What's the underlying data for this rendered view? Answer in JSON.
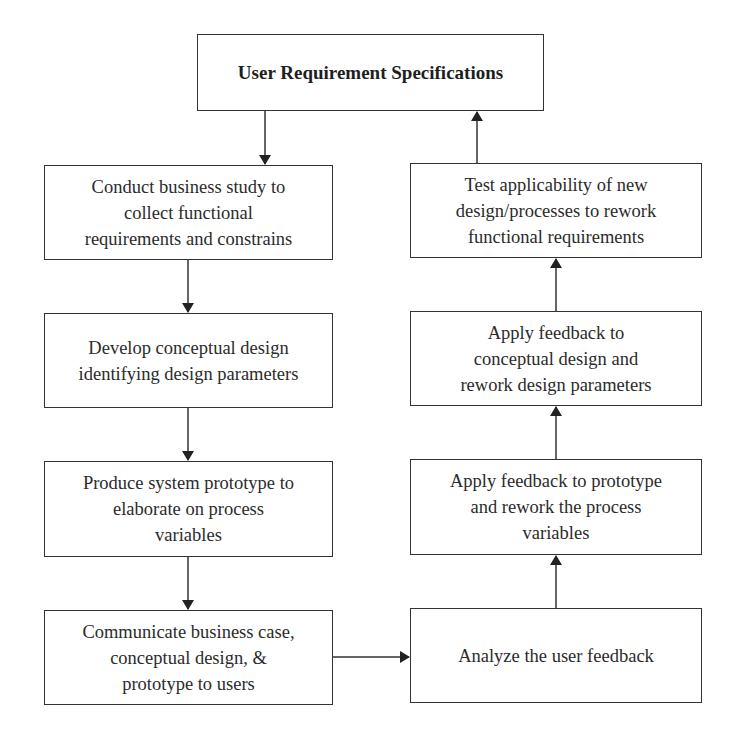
{
  "diagram": {
    "title_box": {
      "label": "User Requirement Specifications"
    },
    "left_column": [
      {
        "label": "Conduct business study to\ncollect functional\nrequirements and constrains"
      },
      {
        "label": "Develop conceptual design\nidentifying design parameters"
      },
      {
        "label": "Produce system prototype to\nelaborate on process\nvariables"
      },
      {
        "label": "Communicate business case,\nconceptual design, &\nprototype to users"
      }
    ],
    "right_column": [
      {
        "label": "Test applicability of new\ndesign/processes to rework\nfunctional requirements"
      },
      {
        "label": "Apply feedback to\nconceptual design and\nrework design parameters"
      },
      {
        "label": "Apply feedback to prototype\nand rework the process\nvariables"
      },
      {
        "label": "Analyze the user feedback"
      }
    ],
    "edges": [
      {
        "from": "User Requirement Specifications",
        "to": "Conduct business study"
      },
      {
        "from": "Conduct business study",
        "to": "Develop conceptual design"
      },
      {
        "from": "Develop conceptual design",
        "to": "Produce system prototype"
      },
      {
        "from": "Produce system prototype",
        "to": "Communicate business case"
      },
      {
        "from": "Communicate business case",
        "to": "Analyze the user feedback"
      },
      {
        "from": "Analyze the user feedback",
        "to": "Apply feedback to prototype"
      },
      {
        "from": "Apply feedback to prototype",
        "to": "Apply feedback to conceptual design"
      },
      {
        "from": "Apply feedback to conceptual design",
        "to": "Test applicability"
      },
      {
        "from": "Test applicability",
        "to": "User Requirement Specifications"
      }
    ],
    "colors": {
      "stroke": "#333333",
      "text": "#2b2b2b",
      "background": "#ffffff"
    }
  }
}
